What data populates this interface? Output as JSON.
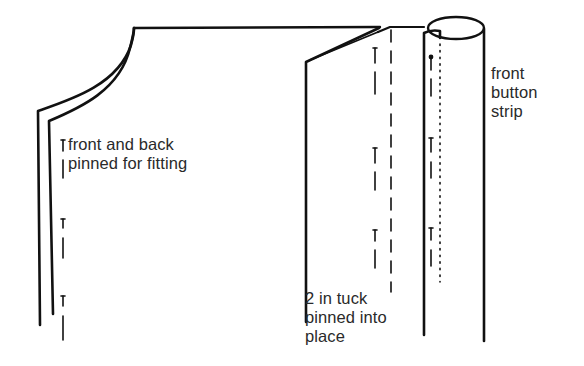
{
  "diagram": {
    "title": "",
    "stroke_color": "#111111",
    "text_color": "#2a2a2a",
    "background": "#ffffff",
    "labels": {
      "front_back": {
        "lines": [
          "front and back",
          "pinned for fitting"
        ]
      },
      "tuck": {
        "lines": [
          "2 in tuck",
          "pinned into",
          "place"
        ]
      },
      "strip": {
        "lines": [
          "front",
          "button",
          "strip"
        ]
      }
    },
    "components": [
      {
        "name": "garment-panel-front-back",
        "description": "double-edged garment panel with curved armhole/neckline"
      },
      {
        "name": "tuck-fold",
        "description": "2 in tuck folded and pinned, dashed stitch line"
      },
      {
        "name": "front-button-strip",
        "description": "rolled cylindrical front button strip with dotted stitch line"
      }
    ],
    "pins": {
      "front_back_count": 3,
      "tuck_count": 3,
      "strip_count": 3
    }
  }
}
